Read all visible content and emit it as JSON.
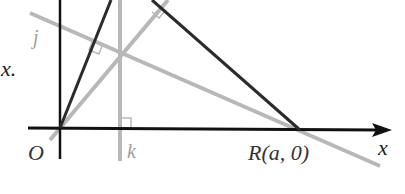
{
  "diagram": {
    "type": "geometry",
    "labels": {
      "origin": "O",
      "point_r": "R(a, 0)",
      "x_axis": "x",
      "line_j": "j",
      "line_k": "k",
      "side_text": "x."
    },
    "colors": {
      "triangle_sides": "#2b2b2b",
      "axes": "#111111",
      "altitudes": "#b8b8b8",
      "altitude_labels": "#a0a0a0",
      "text": "#333333"
    }
  }
}
